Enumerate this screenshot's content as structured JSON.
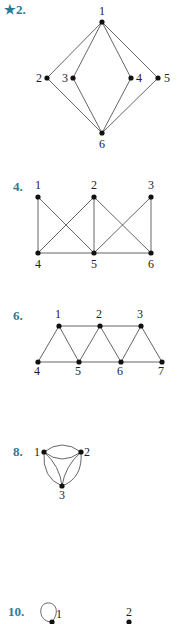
{
  "exercises": [
    {
      "label": "★2.",
      "starred": true,
      "label_pos": [
        4,
        14
      ],
      "nodes": [
        {
          "id": "1",
          "x": 102,
          "y": 22,
          "lx": 99,
          "ly": 15
        },
        {
          "id": "2",
          "x": 47,
          "y": 78,
          "lx": 36,
          "ly": 82
        },
        {
          "id": "3",
          "x": 73,
          "y": 78,
          "lx": 62,
          "ly": 82
        },
        {
          "id": "4",
          "x": 131,
          "y": 78,
          "lx": 136,
          "ly": 82
        },
        {
          "id": "5",
          "x": 158,
          "y": 78,
          "lx": 164,
          "ly": 82
        },
        {
          "id": "6",
          "x": 102,
          "y": 133,
          "lx": 99,
          "ly": 148
        }
      ],
      "edges": [
        [
          "1",
          "2"
        ],
        [
          "1",
          "3"
        ],
        [
          "1",
          "4"
        ],
        [
          "1",
          "5"
        ],
        [
          "6",
          "2"
        ],
        [
          "6",
          "3"
        ],
        [
          "6",
          "4"
        ],
        [
          "6",
          "5"
        ]
      ]
    },
    {
      "label": "4.",
      "label_pos": [
        13,
        191
      ],
      "nodes": [
        {
          "id": "1",
          "x": 38,
          "y": 197,
          "lx": 35,
          "ly": 189
        },
        {
          "id": "2",
          "x": 94,
          "y": 197,
          "lx": 91,
          "ly": 189
        },
        {
          "id": "3",
          "x": 151,
          "y": 197,
          "lx": 148,
          "ly": 189
        },
        {
          "id": "4",
          "x": 38,
          "y": 253,
          "lx": 35,
          "ly": 268
        },
        {
          "id": "5",
          "x": 94,
          "y": 253,
          "lx": 91,
          "ly": 268
        },
        {
          "id": "6",
          "x": 151,
          "y": 253,
          "lx": 148,
          "ly": 268
        }
      ],
      "edges": [
        [
          "1",
          "4"
        ],
        [
          "1",
          "5"
        ],
        [
          "2",
          "4"
        ],
        [
          "2",
          "5"
        ],
        [
          "2",
          "6"
        ],
        [
          "3",
          "5"
        ],
        [
          "3",
          "6"
        ],
        [
          "4",
          "5"
        ],
        [
          "5",
          "6"
        ]
      ]
    },
    {
      "label": "6.",
      "label_pos": [
        13,
        320
      ],
      "nodes": [
        {
          "id": "1",
          "x": 59,
          "y": 326,
          "lx": 55,
          "ly": 318
        },
        {
          "id": "2",
          "x": 100,
          "y": 326,
          "lx": 96,
          "ly": 318
        },
        {
          "id": "3",
          "x": 141,
          "y": 326,
          "lx": 137,
          "ly": 318
        },
        {
          "id": "4",
          "x": 38,
          "y": 362,
          "lx": 34,
          "ly": 375
        },
        {
          "id": "5",
          "x": 79,
          "y": 362,
          "lx": 75,
          "ly": 375
        },
        {
          "id": "6",
          "x": 121,
          "y": 362,
          "lx": 117,
          "ly": 375
        },
        {
          "id": "7",
          "x": 162,
          "y": 362,
          "lx": 158,
          "ly": 375
        }
      ],
      "edges": [
        [
          "1",
          "2"
        ],
        [
          "2",
          "3"
        ],
        [
          "4",
          "5"
        ],
        [
          "5",
          "6"
        ],
        [
          "6",
          "7"
        ],
        [
          "1",
          "4"
        ],
        [
          "1",
          "5"
        ],
        [
          "2",
          "5"
        ],
        [
          "2",
          "6"
        ],
        [
          "3",
          "6"
        ],
        [
          "3",
          "7"
        ]
      ]
    },
    {
      "label": "8.",
      "label_pos": [
        13,
        456
      ],
      "nodes": [
        {
          "id": "1",
          "x": 44,
          "y": 452,
          "lx": 34,
          "ly": 456
        },
        {
          "id": "2",
          "x": 81,
          "y": 452,
          "lx": 84,
          "ly": 456
        },
        {
          "id": "3",
          "x": 62,
          "y": 486,
          "lx": 59,
          "ly": 499
        }
      ],
      "curved_edges": [
        "M44,452 Q62,438 81,452",
        "M44,452 Q62,466 81,452",
        "M44,452 Q42,478 62,486",
        "M44,452 Q60,466 62,486",
        "M81,452 Q83,478 62,486",
        "M81,452 Q65,466 62,486"
      ]
    },
    {
      "label": "10.",
      "label_pos": [
        8,
        616
      ],
      "nodes": [
        {
          "id": "1",
          "x": 52,
          "y": 622,
          "lx": 56,
          "ly": 618
        },
        {
          "id": "2",
          "x": 129,
          "y": 622,
          "lx": 126,
          "ly": 616
        }
      ],
      "loop": "M52,622 C38,622 38,604 47,603 C56,602 60,612 52,622"
    }
  ]
}
